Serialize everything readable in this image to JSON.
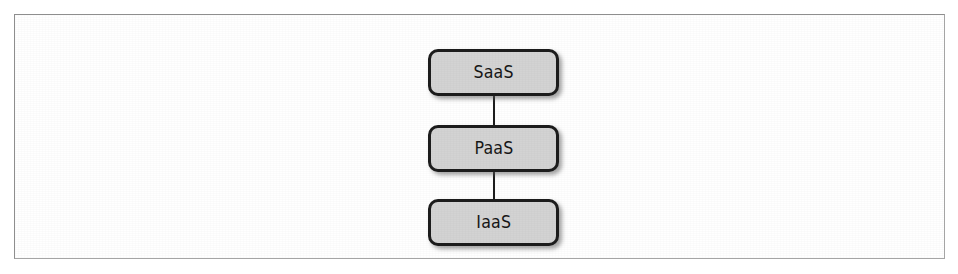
{
  "figure": {
    "frame_border_color": "#9a9a9a",
    "background_color": "#ffffff"
  },
  "chart_data": {
    "type": "diagram",
    "title": "",
    "subtitle": "",
    "layout": "vertical-stack",
    "orientation": "top-to-bottom",
    "node_fill_color": "#d3d3d3",
    "node_border_color": "#1d1d1d",
    "edge_color": "#1d1d1d",
    "nodes": [
      {
        "id": "saas",
        "label": "SaaS",
        "level": 1
      },
      {
        "id": "paas",
        "label": "PaaS",
        "level": 2
      },
      {
        "id": "iaas",
        "label": "IaaS",
        "level": 3
      }
    ],
    "edges": [
      {
        "from": "saas",
        "to": "paas",
        "style": "solid",
        "arrow": "none"
      },
      {
        "from": "paas",
        "to": "iaas",
        "style": "solid",
        "arrow": "none"
      }
    ],
    "annotations": [],
    "legend": []
  }
}
